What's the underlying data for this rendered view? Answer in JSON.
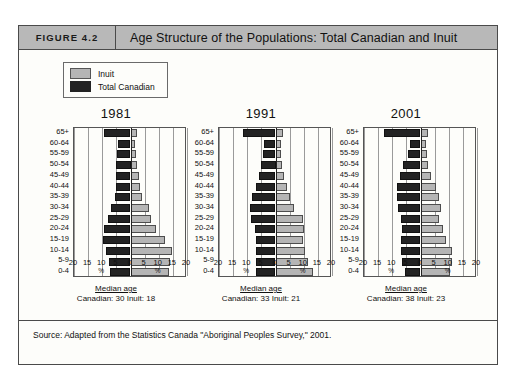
{
  "header": {
    "figure_number": "FIGURE 4.2",
    "title": "Age Structure of the Populations: Total Canadian and Inuit"
  },
  "legend": {
    "items": [
      {
        "label": "Inuit",
        "color": "#b5b5b5",
        "swatch": "inuit"
      },
      {
        "label": "Total Canadian",
        "color": "#232323",
        "swatch": "canadian"
      }
    ]
  },
  "source": "Source: Adapted from the Statistics Canada \"Aboriginal Peoples Survey,\" 2001.",
  "median_caption_title": "Median age",
  "axis": {
    "tick_labels": [
      "20",
      "15",
      "10",
      "5",
      "0",
      "5",
      "10",
      "15",
      "20"
    ],
    "percent_symbol": "%",
    "max": 20
  },
  "chart_data": {
    "type": "bar",
    "title": "Age Structure of the Populations: Total Canadian and Inuit",
    "subtype": "population-pyramid",
    "xlabel": "%",
    "ylabel": "Age group",
    "xlim": [
      -20,
      20
    ],
    "grid": true,
    "legend_position": "top-left",
    "categories": [
      "65+",
      "60-64",
      "55-59",
      "50-54",
      "45-49",
      "40-44",
      "35-39",
      "30-34",
      "25-29",
      "20-24",
      "15-19",
      "10-14",
      "5-9",
      "0-4"
    ],
    "panels": [
      {
        "year": "1981",
        "median_age_canadian": "30",
        "median_age_inuit": "18",
        "median_line": "Canadian: 30  Inuit: 18",
        "series": [
          {
            "name": "Total Canadian",
            "side": "left",
            "color": "#232323",
            "values": [
              9.5,
              4.5,
              4.8,
              5.0,
              5.2,
              5.3,
              5.6,
              6.8,
              7.8,
              9.4,
              9.9,
              8.8,
              7.6,
              7.2
            ]
          },
          {
            "name": "Inuit",
            "side": "right",
            "color": "#b5b5b5",
            "values": [
              2.4,
              1.7,
              2.0,
              2.4,
              3.0,
              3.2,
              4.0,
              6.6,
              7.2,
              9.2,
              12.2,
              14.8,
              14.0,
              13.6
            ]
          }
        ]
      },
      {
        "year": "1991",
        "median_age_canadian": "33",
        "median_age_inuit": "21",
        "median_line": "Canadian: 33  Inuit: 21",
        "series": [
          {
            "name": "Total Canadian",
            "side": "left",
            "color": "#232323",
            "values": [
              11.6,
              4.2,
              4.4,
              5.0,
              5.8,
              7.0,
              8.2,
              9.0,
              8.8,
              7.4,
              6.8,
              6.9,
              6.9,
              6.9
            ]
          },
          {
            "name": "Inuit",
            "side": "right",
            "color": "#b5b5b5",
            "values": [
              2.6,
              1.8,
              2.0,
              2.3,
              2.9,
              4.2,
              5.1,
              6.6,
              9.6,
              10.2,
              9.6,
              10.6,
              11.6,
              13.4
            ]
          }
        ]
      },
      {
        "year": "2001",
        "median_age_canadian": "38",
        "median_age_inuit": "23",
        "median_line": "Canadian: 38  Inuit: 23",
        "series": [
          {
            "name": "Total Canadian",
            "side": "left",
            "color": "#232323",
            "values": [
              12.8,
              3.8,
              4.6,
              6.2,
              7.2,
              8.2,
              8.4,
              8.0,
              7.0,
              6.6,
              6.8,
              7.0,
              6.6,
              5.6
            ]
          },
          {
            "name": "Inuit",
            "side": "right",
            "color": "#b5b5b5",
            "values": [
              2.8,
              2.0,
              2.3,
              2.7,
              3.8,
              5.4,
              6.4,
              7.4,
              6.6,
              7.8,
              9.2,
              11.2,
              11.0,
              10.6
            ]
          }
        ]
      }
    ]
  }
}
